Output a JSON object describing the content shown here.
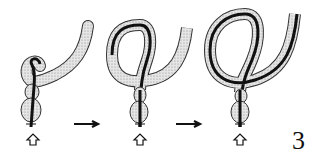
{
  "figure": {
    "label": "3",
    "panels": [
      {
        "id": "step-1",
        "description": "scope entering colon, small loop at tip"
      },
      {
        "id": "step-2",
        "description": "scope forming alpha loop"
      },
      {
        "id": "step-3",
        "description": "scope with larger alpha loop"
      }
    ],
    "arrows": [
      "right-arrow",
      "right-arrow"
    ],
    "colors": {
      "line": "#111111",
      "colon_fill": "#cfcfcf",
      "background": "#ffffff"
    }
  }
}
